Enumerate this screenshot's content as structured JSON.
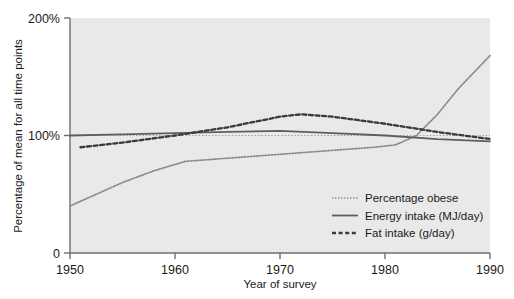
{
  "chart_data": {
    "type": "line",
    "title": "",
    "subtitle": "",
    "xlabel": "Year of survey",
    "ylabel": "Percentage of mean for all time points",
    "xlim": [
      1950,
      1990
    ],
    "ylim": [
      0,
      200
    ],
    "xticks": [
      "1950",
      "1960",
      "1970",
      "1980",
      "1990"
    ],
    "xtick_values": [
      1950,
      1960,
      1970,
      1980,
      1990
    ],
    "yticks": [
      "0",
      "100%",
      "200%"
    ],
    "ytick_values": [
      0,
      100,
      200
    ],
    "grid": false,
    "reference_line_y": 100,
    "plot_background": "#e9e9e9",
    "axis_color": "#6f6f6f",
    "legend_position": "inside lower right",
    "series": [
      {
        "name": "Percentage obese",
        "style": "dotted",
        "color": "#8a8a8a",
        "x": [
          1950,
          1955,
          1958,
          1961,
          1964,
          1967,
          1970,
          1973,
          1976,
          1979,
          1981,
          1983,
          1985,
          1987,
          1990
        ],
        "values": [
          40,
          60,
          70,
          78,
          80,
          82,
          84,
          86,
          88,
          90,
          92,
          100,
          118,
          140,
          168
        ]
      },
      {
        "name": "Energy intake (MJ/day)",
        "style": "solid",
        "color": "#5e5e5e",
        "x": [
          1950,
          1955,
          1960,
          1965,
          1970,
          1975,
          1980,
          1985,
          1990
        ],
        "values": [
          100,
          101,
          102,
          103,
          104,
          102,
          100,
          97,
          95
        ]
      },
      {
        "name": "Fat intake (g/day)",
        "style": "dashed",
        "color": "#3a3a3a",
        "x": [
          1951,
          1955,
          1960,
          1965,
          1970,
          1972,
          1975,
          1980,
          1985,
          1990
        ],
        "values": [
          90,
          94,
          100,
          107,
          116,
          118,
          116,
          110,
          103,
          97
        ]
      }
    ],
    "legend": [
      {
        "label": "Percentage obese",
        "style": "dotted",
        "color": "#8a8a8a"
      },
      {
        "label": "Energy intake (MJ/day)",
        "style": "solid",
        "color": "#5e5e5e"
      },
      {
        "label": "Fat intake (g/day)",
        "style": "dashed",
        "color": "#3a3a3a"
      }
    ]
  }
}
